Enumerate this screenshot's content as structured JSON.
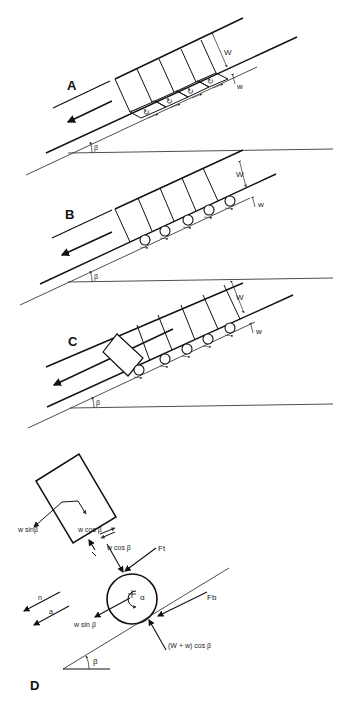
{
  "figure": {
    "panels": [
      {
        "id": "A",
        "label": "A",
        "description": "Block sliding over slope with shear cells (rotational vortices) beneath blocks",
        "dim_W": "W",
        "dim_w": "w",
        "angle": "β"
      },
      {
        "id": "B",
        "label": "B",
        "description": "Block riding on rolling particles (rollers) beneath",
        "dim_W": "W",
        "dim_w": "w",
        "angle": "β"
      },
      {
        "id": "C",
        "label": "C",
        "description": "Block on rollers with a tilted block at the front",
        "dim_W": "W",
        "dim_w": "w",
        "angle": "β"
      },
      {
        "id": "D",
        "label": "D",
        "description": "Free-body diagram of block and roller on slope"
      }
    ],
    "forces": {
      "block_downslope": "w sinβ",
      "block_normal": "w cos β",
      "roller_normal_top": "w cos β",
      "top_friction": "Ft",
      "roller_downslope": "w sin β",
      "roller_bottom_friction": "Fb",
      "roller_normal_bottom": "(W + w) cos β",
      "angular_accel": "α",
      "acc_n": "n",
      "acc_a": "a",
      "angle": "β"
    }
  }
}
